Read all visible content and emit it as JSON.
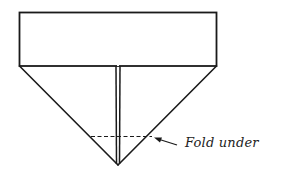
{
  "diagram": {
    "type": "origami-fold-instruction",
    "shapes": {
      "top_band": {
        "x": 19,
        "y": 12,
        "width": 198,
        "height": 54
      },
      "triangle": {
        "left": [
          19,
          66
        ],
        "right": [
          217,
          66
        ],
        "apex": [
          118,
          165
        ]
      },
      "center_crease": {
        "x1": 116,
        "x2": 120,
        "y_top": 66,
        "y_bottom": 165
      },
      "fold_line": {
        "y": 136,
        "x_start": 91,
        "x_end": 152,
        "style": "dashed"
      }
    },
    "annotation": {
      "label": "Fold under",
      "arrow_from": [
        176,
        145
      ],
      "arrow_to": [
        154,
        137
      ]
    },
    "colors": {
      "stroke": "#1a1a1a",
      "background": "#ffffff"
    }
  }
}
